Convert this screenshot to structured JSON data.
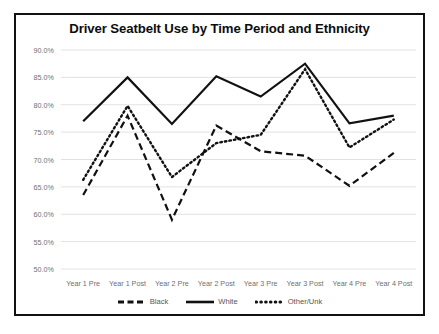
{
  "chart_data": {
    "type": "line",
    "title": "Driver Seatbelt Use by Time Period and Ethnicity",
    "xlabel": "",
    "ylabel": "",
    "categories": [
      "Year 1 Pre",
      "Year 1 Post",
      "Year 2 Pre",
      "Year 2 Post",
      "Year 3 Pre",
      "Year 3 Post",
      "Year 4 Pre",
      "Year 4 Post"
    ],
    "ylim": [
      50.0,
      90.0
    ],
    "ytick_labels": [
      "90.0%",
      "85.0%",
      "80.0%",
      "75.0%",
      "70.0%",
      "65.0%",
      "60.0%",
      "55.0%",
      "50.0%"
    ],
    "ytick_values": [
      90.0,
      85.0,
      80.0,
      75.0,
      70.0,
      65.0,
      60.0,
      55.0,
      50.0
    ],
    "grid": true,
    "legend_position": "bottom",
    "series": [
      {
        "name": "Black",
        "style": "dashed",
        "color": "#111111",
        "values": [
          63.5,
          78.0,
          59.0,
          76.2,
          71.5,
          70.7,
          65.2,
          71.2
        ]
      },
      {
        "name": "White",
        "style": "solid",
        "color": "#111111",
        "values": [
          77.0,
          85.0,
          76.5,
          85.2,
          81.5,
          87.5,
          76.6,
          78.0
        ]
      },
      {
        "name": "Other/Unk",
        "style": "dotted",
        "color": "#111111",
        "values": [
          66.3,
          79.8,
          66.8,
          73.0,
          74.5,
          86.5,
          72.2,
          77.3
        ]
      }
    ]
  }
}
